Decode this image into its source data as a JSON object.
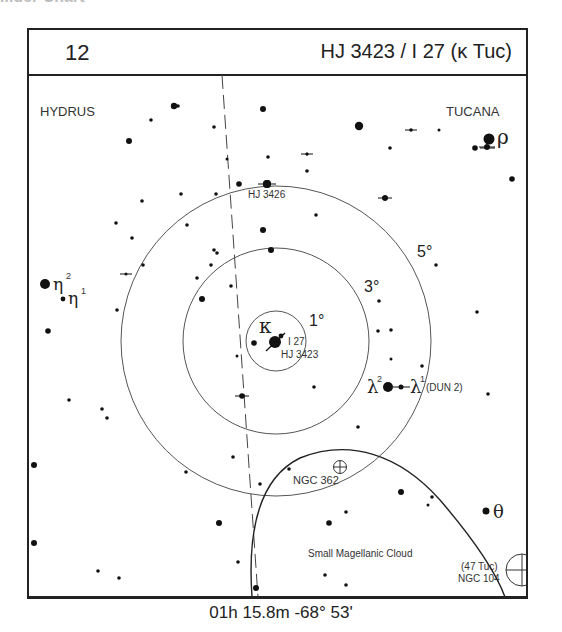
{
  "page_header_partial": "...der Chart",
  "header": {
    "chart_number": "12",
    "title": "HJ 3423 / I 27 (κ Tuc)"
  },
  "constellations": [
    {
      "name": "HYDRUS",
      "x": 40,
      "y": 115
    },
    {
      "name": "TUCANA",
      "x": 446,
      "y": 115
    }
  ],
  "circles": [
    {
      "label": "1°",
      "radius_px": 30
    },
    {
      "label": "3°",
      "radius_px": 93
    },
    {
      "label": "5°",
      "radius_px": 155
    }
  ],
  "center": {
    "x": 276,
    "y": 341
  },
  "labels": {
    "kappa": "κ",
    "i27": "I 27",
    "hj3423": "HJ 3423",
    "hj3426": "HJ 3426",
    "rho": "ρ",
    "eta2": "η",
    "eta2_sup": "2",
    "eta1": "η",
    "eta1_sup": "1",
    "lambda2": "λ",
    "lambda2_sup": "2",
    "lambda1": "λ",
    "lambda1_sup": "1",
    "dun2": "(DUN 2)",
    "ngc362": "NGC 362",
    "smc": "Small Magellanic Cloud",
    "tuc47": "(47 Tuc)",
    "ngc104": "NGC 104",
    "theta": "θ"
  },
  "stars": [
    {
      "x": 174,
      "y": 106,
      "r": 3.2
    },
    {
      "x": 178,
      "y": 106,
      "r": 1.8
    },
    {
      "x": 151,
      "y": 120,
      "r": 1.8
    },
    {
      "x": 129,
      "y": 141,
      "r": 3
    },
    {
      "x": 263,
      "y": 109,
      "r": 3
    },
    {
      "x": 359,
      "y": 126,
      "r": 4.2
    },
    {
      "x": 390,
      "y": 148,
      "r": 1.8
    },
    {
      "x": 132,
      "y": 238,
      "r": 1.8
    },
    {
      "x": 214,
      "y": 127,
      "r": 1.8
    },
    {
      "x": 268,
      "y": 157,
      "r": 1.8
    },
    {
      "x": 307,
      "y": 154,
      "r": 1.5
    },
    {
      "x": 307,
      "y": 171,
      "r": 1.8
    },
    {
      "x": 239,
      "y": 184,
      "r": 2.8
    },
    {
      "x": 267,
      "y": 184,
      "r": 4
    },
    {
      "x": 181,
      "y": 194,
      "r": 1.8
    },
    {
      "x": 142,
      "y": 201,
      "r": 1.8
    },
    {
      "x": 216,
      "y": 194,
      "r": 1.8
    },
    {
      "x": 116,
      "y": 223,
      "r": 1.8
    },
    {
      "x": 316,
      "y": 215,
      "r": 1.8
    },
    {
      "x": 263,
      "y": 230,
      "r": 3
    },
    {
      "x": 385,
      "y": 198,
      "r": 2.8
    },
    {
      "x": 475,
      "y": 148,
      "r": 2.8
    },
    {
      "x": 487,
      "y": 147,
      "r": 2.8
    },
    {
      "x": 512,
      "y": 179,
      "r": 2.8
    },
    {
      "x": 439,
      "y": 130,
      "r": 1.5
    },
    {
      "x": 436,
      "y": 265,
      "r": 1.8
    },
    {
      "x": 477,
      "y": 312,
      "r": 1.8
    },
    {
      "x": 379,
      "y": 301,
      "r": 1.8
    },
    {
      "x": 227,
      "y": 159,
      "r": 1.5
    },
    {
      "x": 187,
      "y": 225,
      "r": 1.8
    },
    {
      "x": 214,
      "y": 250,
      "r": 1.8
    },
    {
      "x": 217,
      "y": 253,
      "r": 1.8
    },
    {
      "x": 143,
      "y": 265,
      "r": 1.8
    },
    {
      "x": 197,
      "y": 278,
      "r": 1.8
    },
    {
      "x": 211,
      "y": 265,
      "r": 1.8
    },
    {
      "x": 271,
      "y": 250,
      "r": 3
    },
    {
      "x": 231,
      "y": 286,
      "r": 1.8
    },
    {
      "x": 202,
      "y": 299,
      "r": 3
    },
    {
      "x": 48,
      "y": 331,
      "r": 2.8
    },
    {
      "x": 117,
      "y": 310,
      "r": 1.8
    },
    {
      "x": 237,
      "y": 356,
      "r": 1.5
    },
    {
      "x": 254,
      "y": 343,
      "r": 2.8
    },
    {
      "x": 378,
      "y": 331,
      "r": 1.8
    },
    {
      "x": 391,
      "y": 330,
      "r": 1.8
    },
    {
      "x": 391,
      "y": 359,
      "r": 1.5
    },
    {
      "x": 314,
      "y": 387,
      "r": 1.8
    },
    {
      "x": 422,
      "y": 366,
      "r": 1.8
    },
    {
      "x": 488,
      "y": 394,
      "r": 1.8
    },
    {
      "x": 358,
      "y": 427,
      "r": 1.8
    },
    {
      "x": 69,
      "y": 400,
      "r": 1.8
    },
    {
      "x": 102,
      "y": 409,
      "r": 1.8
    },
    {
      "x": 107,
      "y": 418,
      "r": 1.8
    },
    {
      "x": 34,
      "y": 465,
      "r": 3
    },
    {
      "x": 186,
      "y": 472,
      "r": 1.8
    },
    {
      "x": 233,
      "y": 457,
      "r": 1.8
    },
    {
      "x": 219,
      "y": 523,
      "r": 3
    },
    {
      "x": 34,
      "y": 543,
      "r": 3
    },
    {
      "x": 98,
      "y": 571,
      "r": 1.8
    },
    {
      "x": 119,
      "y": 578,
      "r": 1.8
    },
    {
      "x": 238,
      "y": 562,
      "r": 1.8
    },
    {
      "x": 256,
      "y": 588,
      "r": 3
    },
    {
      "x": 289,
      "y": 469,
      "r": 1.8
    },
    {
      "x": 329,
      "y": 523,
      "r": 2.8
    },
    {
      "x": 346,
      "y": 512,
      "r": 1.8
    },
    {
      "x": 325,
      "y": 575,
      "r": 1.8
    },
    {
      "x": 346,
      "y": 585,
      "r": 1.8
    },
    {
      "x": 260,
      "y": 484,
      "r": 1.8
    },
    {
      "x": 401,
      "y": 492,
      "r": 3
    },
    {
      "x": 432,
      "y": 497,
      "r": 1.8
    },
    {
      "x": 428,
      "y": 505,
      "r": 1.5
    }
  ],
  "doubles": [
    {
      "x": 411,
      "y": 130,
      "r": 1.8,
      "tick": 6
    },
    {
      "x": 307,
      "y": 154,
      "r": 1.5,
      "tick": 6
    },
    {
      "x": 385,
      "y": 198,
      "r": 2.8,
      "tick": 7
    },
    {
      "x": 126,
      "y": 274,
      "r": 1.5,
      "tick": 6
    },
    {
      "x": 242,
      "y": 396,
      "r": 2.8,
      "tick": 7
    },
    {
      "x": 267,
      "y": 184,
      "r": 4,
      "tick": 9
    },
    {
      "x": 487,
      "y": 147,
      "r": 2.8,
      "tick": 8
    }
  ],
  "footer": {
    "coordinates": "01h 15.8m  -68° 53'"
  }
}
